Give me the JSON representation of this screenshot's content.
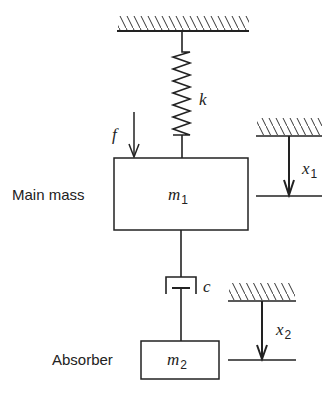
{
  "diagram": {
    "spring_label": "k",
    "force_label": "f",
    "damper_label": "c",
    "main_mass": {
      "label": "Main mass",
      "symbol": "m",
      "subscript": "1"
    },
    "absorber": {
      "label": "Absorber",
      "symbol": "m",
      "subscript": "2"
    },
    "displacement_1": {
      "symbol": "x",
      "subscript": "1"
    },
    "displacement_2": {
      "symbol": "x",
      "subscript": "2"
    }
  }
}
